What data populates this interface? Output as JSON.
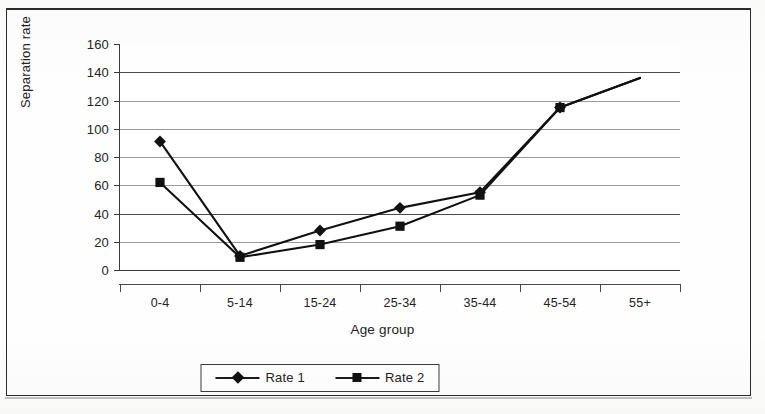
{
  "chart_data": {
    "type": "line",
    "title": "",
    "xlabel": "Age group",
    "ylabel": "Separation rate",
    "categories": [
      "0-4",
      "5-14",
      "15-24",
      "25-34",
      "35-44",
      "45-54",
      "55+"
    ],
    "series": [
      {
        "name": "Rate 1",
        "marker": "diamond",
        "color": "#111111",
        "values": [
          91,
          10,
          28,
          44,
          55,
          115,
          136
        ]
      },
      {
        "name": "Rate 2",
        "marker": "square",
        "color": "#111111",
        "values": [
          62,
          9,
          18,
          31,
          53,
          115,
          136
        ]
      }
    ],
    "ylim": [
      0,
      160
    ],
    "yticks": [
      0,
      20,
      40,
      60,
      80,
      100,
      120,
      140,
      160
    ],
    "ytick_labels": [
      "0",
      "20",
      "40",
      "60",
      "80",
      "100",
      "120",
      "140",
      "160"
    ],
    "grid": true,
    "grid_axis": "y",
    "legend_position": "bottom"
  },
  "legend": {
    "items": [
      {
        "label": "Rate 1",
        "marker": "diamond"
      },
      {
        "label": "Rate 2",
        "marker": "square"
      }
    ]
  },
  "axes": {
    "y_title": "Separation rate",
    "x_title": "Age group"
  }
}
